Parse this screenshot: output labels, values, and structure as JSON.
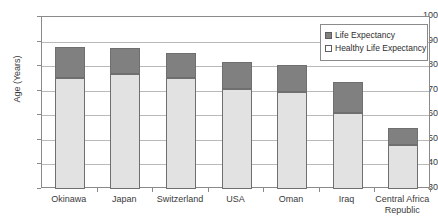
{
  "chart_data": {
    "type": "bar",
    "stacked": true,
    "title": "",
    "xlabel": "",
    "ylabel": "Age (Years)",
    "ylim": [
      30,
      100
    ],
    "ytick_step": 10,
    "yticks": [
      100,
      90,
      80,
      70,
      60,
      50,
      40,
      30
    ],
    "grid": true,
    "legend_position": "top-right",
    "categories": [
      "Okinawa",
      "Japan",
      "Switzerland",
      "USA",
      "Oman",
      "Iraq",
      "Central Africa\nRepublic"
    ],
    "series": [
      {
        "name": "Healthy Life Expectancy",
        "color": "#e2e2e2",
        "values": [
          75.3,
          77.0,
          75.0,
          70.5,
          69.5,
          61.0,
          48.0
        ]
      },
      {
        "name": "Life Expectancy",
        "color": "#808080",
        "values": [
          87.8,
          87.5,
          85.5,
          81.5,
          80.5,
          73.5,
          55.0
        ]
      }
    ]
  },
  "legend": {
    "items": [
      {
        "label": "Life Expectancy",
        "swatch": "dark-gray-swatch"
      },
      {
        "label": "Healthy Life Expectancy",
        "swatch": "light-swatch"
      }
    ]
  },
  "axis": {
    "y_title": "Age (Years)",
    "y_tick_labels": [
      "100",
      "90",
      "80",
      "70",
      "60",
      "50",
      "40",
      "30"
    ]
  },
  "colors": {
    "life_expectancy": "#808080",
    "healthy_life_expectancy": "#e2e2e2",
    "gridline": "#b9b9b9",
    "axis": "#8a8a8a",
    "text": "#3a3a3a"
  }
}
